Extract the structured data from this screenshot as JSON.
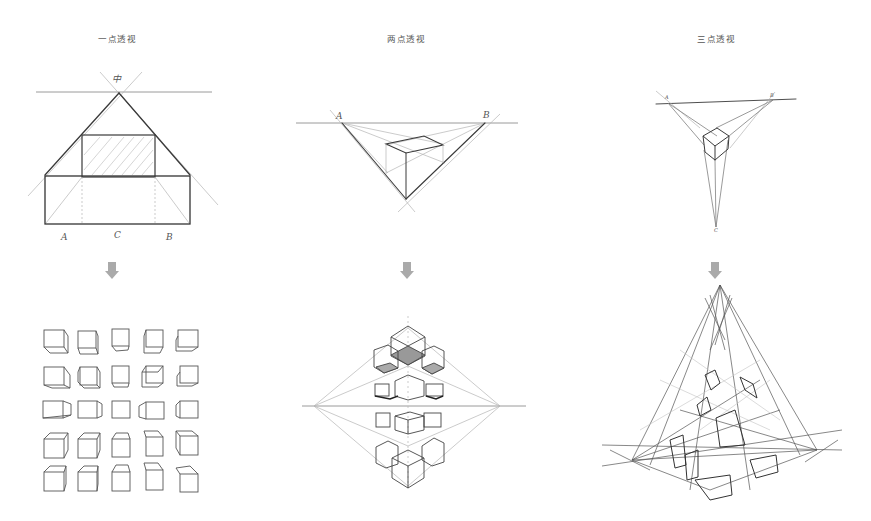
{
  "columns": [
    {
      "title": "一点透视",
      "top_diagram": {
        "labels": [
          "A",
          "C",
          "B"
        ],
        "vanishing_point_label": "中"
      },
      "bottom_diagram": {
        "description": "cube-grid",
        "rows": 5,
        "cols": 5
      }
    },
    {
      "title": "两点透视",
      "top_diagram": {
        "labels": [
          "A",
          "B"
        ]
      },
      "bottom_diagram": {
        "description": "mirrored-cube-cluster"
      }
    },
    {
      "title": "三点透视",
      "top_diagram": {
        "labels": [
          "A",
          "B",
          "C"
        ]
      },
      "bottom_diagram": {
        "description": "three-point-building-sketch"
      }
    }
  ],
  "arrow_color": "#aaaaaa"
}
